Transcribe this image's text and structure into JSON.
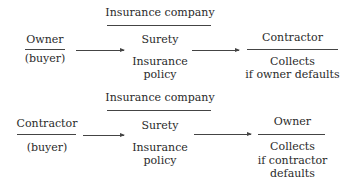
{
  "diagrams": [
    {
      "name": "owner-buyer-bond",
      "header": "Insurance company",
      "buyer": {
        "title": "Owner",
        "subtitle": "(buyer)"
      },
      "surety": {
        "title": "Surety",
        "line1": "Insurance",
        "line2": "policy"
      },
      "beneficiary": {
        "title": "Contractor",
        "line1": "Collects",
        "line2": "if owner defaults"
      }
    },
    {
      "name": "contractor-buyer-bond",
      "header": "Insurance company",
      "buyer": {
        "title": "Contractor",
        "subtitle": "(buyer)"
      },
      "surety": {
        "title": "Surety",
        "line1": "Insurance",
        "line2": "policy"
      },
      "beneficiary": {
        "title": "Owner",
        "line1": "Collects",
        "line2": "if contractor",
        "line3": "defaults"
      }
    }
  ],
  "colors": {
    "text": "#2a2a2a",
    "line": "#444444",
    "background": "#ffffff"
  }
}
